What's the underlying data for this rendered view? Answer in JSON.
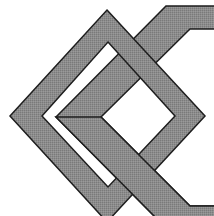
{
  "diagram": {
    "colors": {
      "background": "#ffffff",
      "band_fill": "#8a8a8a",
      "outline": "#1e1e1e",
      "interior": "#ffffff"
    },
    "shapes": [
      {
        "name": "diamond-frame",
        "type": "diamond"
      },
      {
        "name": "hexagon-frame",
        "type": "hexagon",
        "cropped": true
      }
    ]
  }
}
